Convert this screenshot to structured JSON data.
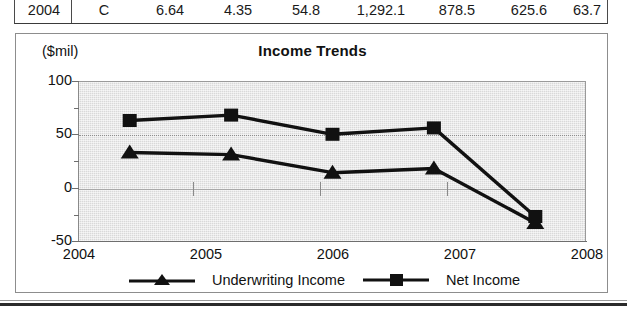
{
  "table_row": {
    "columns": [
      "Year",
      "Rating",
      "Col3",
      "Col4",
      "Col5",
      "Col6",
      "Col7",
      "Col8",
      "Col9"
    ],
    "values": [
      "2004",
      "C",
      "6.64",
      "4.35",
      "54.8",
      "1,292.1",
      "878.5",
      "625.6",
      "63.7"
    ]
  },
  "chart": {
    "title": "Income Trends",
    "unit_label": "($mil)"
  },
  "legend": {
    "items": [
      {
        "label": "Underwriting Income",
        "marker": "triangle-marker",
        "color": "#111111"
      },
      {
        "label": "Net Income",
        "marker": "square-marker",
        "color": "#111111"
      }
    ]
  },
  "chart_data": {
    "type": "line",
    "title": "Income Trends",
    "xlabel": "",
    "ylabel": "($mil)",
    "categories": [
      "2004",
      "2005",
      "2006",
      "2007",
      "2008"
    ],
    "x_tick_labels": [
      "2004",
      "2005",
      "2006",
      "2007",
      "2008"
    ],
    "y_tick_labels": [
      "100",
      "50",
      "0",
      "-50"
    ],
    "y_major_ticks": [
      100,
      50,
      0,
      -50
    ],
    "y_minor_ticks": [
      75,
      25,
      -25
    ],
    "ylim": [
      -50,
      100
    ],
    "grid": true,
    "legend_position": "bottom",
    "series": [
      {
        "name": "Underwriting Income",
        "marker": "triangle",
        "values": [
          33,
          31,
          14,
          18,
          -33
        ]
      },
      {
        "name": "Net Income",
        "marker": "square",
        "values": [
          63,
          68,
          50,
          56,
          -27
        ]
      }
    ]
  }
}
